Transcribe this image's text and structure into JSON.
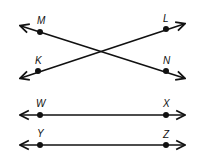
{
  "diagram": {
    "type": "geometry-lines",
    "color": "#111111",
    "background": "#ffffff",
    "points": [
      {
        "id": "M",
        "label": "M",
        "x": 40,
        "y": 32,
        "lx": 37,
        "ly": 24
      },
      {
        "id": "L",
        "label": "L",
        "x": 166,
        "y": 29,
        "lx": 163,
        "ly": 22
      },
      {
        "id": "K",
        "label": "K",
        "x": 38,
        "y": 71,
        "lx": 35,
        "ly": 64
      },
      {
        "id": "N",
        "label": "N",
        "x": 166,
        "y": 71,
        "lx": 163,
        "ly": 64
      },
      {
        "id": "W",
        "label": "W",
        "x": 40,
        "y": 115,
        "lx": 36,
        "ly": 107
      },
      {
        "id": "X",
        "label": "X",
        "x": 166,
        "y": 115,
        "lx": 163,
        "ly": 107
      },
      {
        "id": "Y",
        "label": "Y",
        "x": 40,
        "y": 145,
        "lx": 37,
        "ly": 137
      },
      {
        "id": "Z",
        "label": "Z",
        "x": 166,
        "y": 145,
        "lx": 163,
        "ly": 138
      }
    ],
    "lines": [
      {
        "id": "line-MN",
        "through": [
          "M",
          "N"
        ],
        "x1": 21,
        "y1": 26,
        "x2": 184,
        "y2": 78
      },
      {
        "id": "line-KL",
        "through": [
          "K",
          "L"
        ],
        "x1": 21,
        "y1": 78,
        "x2": 184,
        "y2": 24
      },
      {
        "id": "line-WX",
        "through": [
          "W",
          "X"
        ],
        "x1": 21,
        "y1": 115,
        "x2": 184,
        "y2": 115
      },
      {
        "id": "line-YZ",
        "through": [
          "Y",
          "Z"
        ],
        "x1": 21,
        "y1": 145,
        "x2": 184,
        "y2": 145
      }
    ]
  }
}
